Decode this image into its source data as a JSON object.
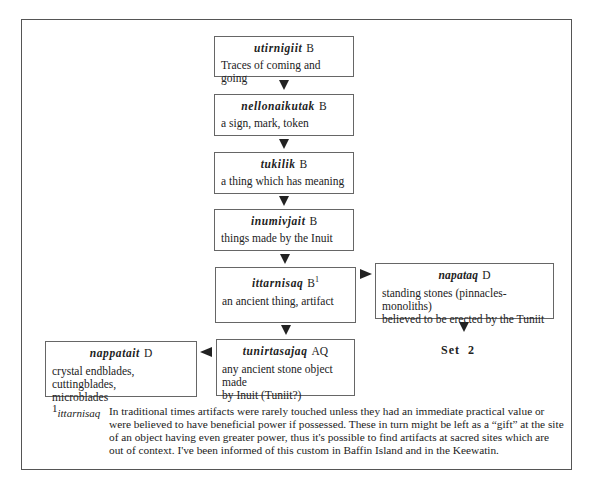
{
  "diagram": {
    "boxes": [
      {
        "term": "utirnigiit",
        "code": "B",
        "sup": "",
        "gloss": "Traces of coming and going"
      },
      {
        "term": "nellonaikutak",
        "code": "B",
        "sup": "",
        "gloss": "a sign, mark, token"
      },
      {
        "term": "tukilik",
        "code": "B",
        "sup": "",
        "gloss": "a thing which has meaning"
      },
      {
        "term": "inumivjait",
        "code": "B",
        "sup": "",
        "gloss": "things made by the Inuit"
      },
      {
        "term": "ittarnisaq",
        "code": "B",
        "sup": "1",
        "gloss": "an ancient thing, artifact"
      },
      {
        "term": "napataq",
        "code": "D",
        "sup": "",
        "gloss": "standing stones (pinnacles-monoliths)\nbelieved to be erected by the Tuniit"
      },
      {
        "term": "tunirtasajaq",
        "code": "AQ",
        "sup": "",
        "gloss": "any ancient stone object made\nby Inuit (Tuniit?)"
      },
      {
        "term": "nappatait",
        "code": "D",
        "sup": "",
        "gloss": "crystal endblades, cuttingblades,\nmicroblades"
      }
    ],
    "set_label": "Set  2"
  },
  "footnote": {
    "marker": "1",
    "term": "ittarnisaq",
    "text": "In traditional times artifacts were rarely touched unless they had an immediate practical value or were believed to have beneficial power if possessed. These in turn might be left as a “gift” at the site of an object having even greater power, thus it's possible to find artifacts at sacred sites which are out of context. I've been informed of this custom in Baffin Island and in the Keewatin."
  },
  "colors": {
    "border": "#555555",
    "arrow": "#222222",
    "background": "#ffffff"
  }
}
